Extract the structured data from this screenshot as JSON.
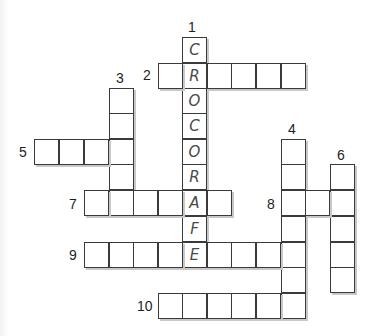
{
  "puzzle": {
    "type": "crossword",
    "cell_width": 24.6,
    "cell_height": 25.5,
    "col_x": {
      "-2": 34,
      "-1": 59,
      "0": 84,
      "1": 109,
      "2": 133,
      "3": 158,
      "4": 182,
      "5": 207,
      "6": 231,
      "7": 256,
      "8": 281,
      "9": 305,
      "10": 330
    },
    "row_y": {
      "0": 37,
      "1": 63,
      "2": 88,
      "3": 113,
      "4": 139,
      "5": 164,
      "6": 190,
      "7": 216,
      "8": 242,
      "9": 267,
      "10": 293
    },
    "colors": {
      "line": "#3a3a3a",
      "shadow": "#c8c8c8",
      "letter": "#4a4a4a",
      "number": "#1e1e1e",
      "background": "#ffffff"
    },
    "entries": [
      {
        "number": "1",
        "direction": "down",
        "row": 0,
        "col": 4,
        "length": 9,
        "letters": [
          "C",
          "R",
          "O",
          "C",
          "O",
          "R",
          "A",
          "F",
          "E"
        ],
        "label_x": 188,
        "label_y": 20
      },
      {
        "number": "2",
        "direction": "across",
        "row": 1,
        "col": 3,
        "length": 6,
        "letters": [],
        "label_x": 143,
        "label_y": 68
      },
      {
        "number": "3",
        "direction": "down",
        "row": 2,
        "col": 1,
        "length": 5,
        "letters": [],
        "label_x": 116,
        "label_y": 71
      },
      {
        "number": "4",
        "direction": "down",
        "row": 4,
        "col": 8,
        "length": 7,
        "letters": [],
        "label_x": 288,
        "label_y": 122
      },
      {
        "number": "5",
        "direction": "across",
        "row": 4,
        "col": -2,
        "length": 4,
        "letters": [],
        "label_x": 19,
        "label_y": 145
      },
      {
        "number": "6",
        "direction": "down",
        "row": 5,
        "col": 10,
        "length": 5,
        "letters": [],
        "label_x": 337,
        "label_y": 148
      },
      {
        "number": "7",
        "direction": "across",
        "row": 6,
        "col": 0,
        "length": 6,
        "letters": [],
        "label_x": 69,
        "label_y": 197
      },
      {
        "number": "8",
        "direction": "across",
        "row": 6,
        "col": 8,
        "length": 3,
        "letters": [],
        "label_x": 267,
        "label_y": 197
      },
      {
        "number": "9",
        "direction": "across",
        "row": 8,
        "col": 0,
        "length": 9,
        "letters": [],
        "label_x": 69,
        "label_y": 248
      },
      {
        "number": "10",
        "direction": "across",
        "row": 10,
        "col": 3,
        "length": 6,
        "letters": [],
        "label_x": 137,
        "label_y": 299
      }
    ]
  }
}
